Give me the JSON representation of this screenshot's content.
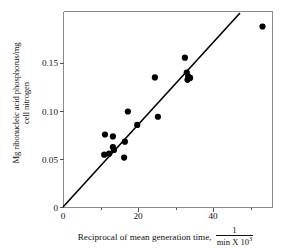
{
  "chart_data": {
    "type": "scatter",
    "title": "",
    "xlabel": "Reciprocal of mean generation time,",
    "xlabel_fraction_numerator": "1",
    "xlabel_fraction_denominator": "min X 10",
    "xlabel_fraction_denominator_exponent": "3",
    "ylabel_line1": "Mg ribonucleic acid phosphorus/mg",
    "ylabel_line2": "cell nitrogen",
    "xlim": [
      0,
      57
    ],
    "ylim": [
      0,
      0.196
    ],
    "grid": false,
    "legend": null,
    "xticks": [
      0,
      20,
      40
    ],
    "xtick_labels": [
      "0",
      "20",
      "40"
    ],
    "xminor_ticks": [
      10,
      30,
      50
    ],
    "yticks": [
      0,
      0.05,
      0.1,
      0.15
    ],
    "ytick_labels": [
      "0",
      "0.05",
      "0.10",
      "0.15"
    ],
    "series": [
      {
        "name": "observations",
        "marker": "filled-circle",
        "color": "#000000",
        "points": [
          {
            "x": 11.2,
            "y": 0.0755
          },
          {
            "x": 11.0,
            "y": 0.0545
          },
          {
            "x": 12.3,
            "y": 0.0555
          },
          {
            "x": 13.3,
            "y": 0.0735
          },
          {
            "x": 13.3,
            "y": 0.0625
          },
          {
            "x": 13.6,
            "y": 0.0595
          },
          {
            "x": 16.5,
            "y": 0.068
          },
          {
            "x": 16.3,
            "y": 0.0515
          },
          {
            "x": 17.3,
            "y": 0.0995
          },
          {
            "x": 19.8,
            "y": 0.0855
          },
          {
            "x": 24.5,
            "y": 0.135
          },
          {
            "x": 25.3,
            "y": 0.094
          },
          {
            "x": 32.5,
            "y": 0.1555
          },
          {
            "x": 33.0,
            "y": 0.14
          },
          {
            "x": 33.4,
            "y": 0.136
          },
          {
            "x": 33.9,
            "y": 0.1345
          },
          {
            "x": 33.2,
            "y": 0.1325
          },
          {
            "x": 53.2,
            "y": 0.188
          }
        ]
      }
    ],
    "fit_line": {
      "name": "regression-line",
      "color": "#000000",
      "through_origin": true,
      "x_start": 0,
      "y_start": 0,
      "x_end": 47.2,
      "y_end": 0.196
    }
  }
}
